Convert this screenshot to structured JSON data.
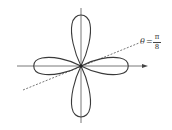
{
  "diagram": {
    "type": "polar-rose",
    "axes": {
      "x_arrow": true,
      "y_arrow": false
    },
    "label": {
      "lhs": "θ",
      "equals": "=",
      "numerator": "π",
      "denominator": "8"
    },
    "colors": {
      "curve": "#3a3a3a",
      "axis": "#555555",
      "dashed": "#555555"
    }
  }
}
